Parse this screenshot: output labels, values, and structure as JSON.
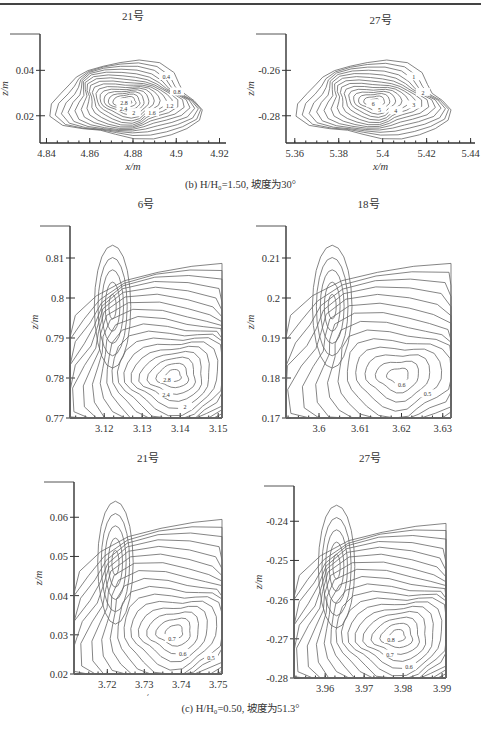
{
  "figure": {
    "captions": {
      "b": "(b) H/H₀=1.50, 坡度为30°",
      "c": "(c) H/H₀=0.50, 坡度为51.3°"
    }
  },
  "chart_data": [
    {
      "id": "b-21",
      "type": "contour",
      "title": "21号",
      "xlabel": "x/m",
      "ylabel": "z/m",
      "xticks": [
        "4.84",
        "4.86",
        "4.88",
        "4.9",
        "4.92"
      ],
      "yticks": [
        "0.02",
        "0.04"
      ],
      "xlim": [
        4.837,
        4.923
      ],
      "ylim": [
        0.008,
        0.056
      ],
      "contour_labels": [
        "0.4",
        "0.8",
        "1.2",
        "1.6",
        "2",
        "2.4",
        "2.8"
      ],
      "peak_value": 2.8
    },
    {
      "id": "b-27",
      "type": "contour",
      "title": "27号",
      "xlabel": "x/m",
      "ylabel": "z/m",
      "xticks": [
        "5.36",
        "5.38",
        "5.4",
        "5.42",
        "5.44"
      ],
      "yticks": [
        "-0.26",
        "-0.28"
      ],
      "xlim": [
        5.356,
        5.442
      ],
      "ylim": [
        -0.292,
        -0.244
      ],
      "contour_labels": [
        "1",
        "2",
        "3",
        "4",
        "5",
        "6"
      ],
      "peak_value": 6
    },
    {
      "id": "c-6",
      "type": "contour",
      "title": "6号",
      "xlabel": "x/m",
      "ylabel": "z/m",
      "xticks": [
        "3.12",
        "3.13",
        "3.14",
        "3.15"
      ],
      "yticks": [
        "0.77",
        "0.78",
        "0.79",
        "0.8",
        "0.81"
      ],
      "xlim": [
        3.111,
        3.151
      ],
      "ylim": [
        0.77,
        0.818
      ],
      "contour_labels": [
        "0.4",
        "0.8",
        "1.2",
        "1.6",
        "2",
        "2.4",
        "2.8"
      ],
      "peak_value": 2.8
    },
    {
      "id": "c-18",
      "type": "contour",
      "title": "18号",
      "xlabel": "x/m",
      "ylabel": "z/m",
      "xticks": [
        "3.6",
        "3.61",
        "3.62",
        "3.63"
      ],
      "yticks": [
        "0.17",
        "0.18",
        "0.19",
        "0.2",
        "0.21"
      ],
      "xlim": [
        3.592,
        3.632
      ],
      "ylim": [
        0.17,
        0.218
      ],
      "contour_labels": [
        "0.2",
        "0.3",
        "0.4",
        "0.5",
        "0.6"
      ],
      "peak_value": 0.6
    },
    {
      "id": "c-21",
      "type": "contour",
      "title": "21号",
      "xlabel": "x/m",
      "ylabel": "z/m",
      "xticks": [
        "3.72",
        "3.73",
        "3.74",
        "3.75"
      ],
      "yticks": [
        "0.02",
        "0.03",
        "0.04",
        "0.05",
        "0.06"
      ],
      "xlim": [
        3.711,
        3.751
      ],
      "ylim": [
        0.02,
        0.069
      ],
      "contour_labels": [
        "0.2",
        "0.3",
        "0.4",
        "0.5",
        "0.6",
        "0.7"
      ],
      "peak_value": 0.7
    },
    {
      "id": "c-27",
      "type": "contour",
      "title": "27号",
      "xlabel": "x/m",
      "ylabel": "z/m",
      "xticks": [
        "3.96",
        "3.97",
        "3.98",
        "3.99"
      ],
      "yticks": [
        "-0.28",
        "-0.27",
        "-0.26",
        "-0.25",
        "-0.24"
      ],
      "xlim": [
        3.952,
        3.991
      ],
      "ylim": [
        -0.28,
        -0.231
      ],
      "contour_labels": [
        "0.2",
        "0.3",
        "0.4",
        "0.5",
        "0.6",
        "0.7",
        "0.8"
      ],
      "peak_value": 0.8
    }
  ]
}
